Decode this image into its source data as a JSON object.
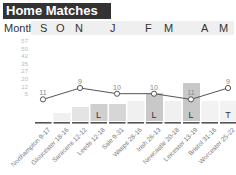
{
  "header": {
    "title": "Home Matches",
    "month_label": "Month"
  },
  "months": [
    {
      "label": "S",
      "x": 40
    },
    {
      "label": "O",
      "x": 56
    },
    {
      "label": "N",
      "x": 75
    },
    {
      "label": "J",
      "x": 110
    },
    {
      "label": "F",
      "x": 145
    },
    {
      "label": "M",
      "x": 164
    },
    {
      "label": "A",
      "x": 201
    },
    {
      "label": "M",
      "x": 219
    }
  ],
  "y_ticks": [
    "57",
    "50",
    "42",
    "35",
    "27",
    "20",
    "12",
    "5"
  ],
  "chart_data": {
    "type": "line",
    "title": "Home Matches",
    "xlabel": "",
    "ylabel": "",
    "ylim": [
      0,
      57
    ],
    "categories": [
      "Northampton 9-17",
      "Gloucester 18-16",
      "Saracens 12-12",
      "Leeds 12-18",
      "Sale 9-31",
      "Wasps 28-16",
      "Irish 26-13",
      "Newcastle 20-18",
      "Leicester 13-19",
      "Bristol 31-16",
      "Worcester 25-22"
    ],
    "series": [
      {
        "name": "Position",
        "points": [
          {
            "index": 0,
            "value": 11
          },
          {
            "index": 2,
            "value": 9
          },
          {
            "index": 4,
            "value": 10
          },
          {
            "index": 6,
            "value": 10
          },
          {
            "index": 8,
            "value": 11
          },
          {
            "index": 10,
            "value": 9
          }
        ]
      }
    ],
    "results": [
      "",
      "",
      "",
      "L",
      "",
      "",
      "L",
      "",
      "L",
      "",
      "T"
    ],
    "bar_shades": [
      "#ffffff",
      "#f0f0f0",
      "#e4e4e4",
      "#cfcfcf",
      "#d6d6d6",
      "#f0f0f0",
      "#c8c8c8",
      "#f0f0f0",
      "#c8c8c8",
      "#f2f2f2",
      "#f2f2f2"
    ],
    "bar_heights": [
      0,
      8,
      14,
      17,
      17,
      20,
      28,
      20,
      38,
      20,
      20
    ],
    "grid": false
  }
}
